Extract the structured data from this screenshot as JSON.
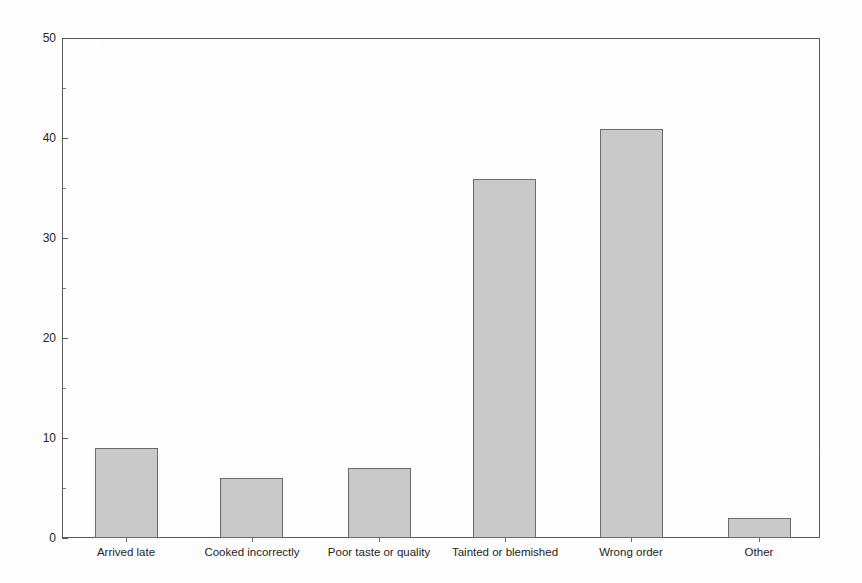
{
  "chart_data": {
    "type": "bar",
    "title": "",
    "subtitle": "",
    "xlabel": "",
    "ylabel": "",
    "categories": [
      "Arrived late",
      "Cooked incorrectly",
      "Poor taste or quality",
      "Tainted or blemished",
      "Wrong order",
      "Other"
    ],
    "values": [
      9,
      6,
      7,
      36,
      41,
      2
    ],
    "ylim": [
      0,
      50
    ],
    "y_major_ticks": [
      0,
      10,
      20,
      30,
      40,
      50
    ],
    "y_minor_ticks": [
      5,
      15,
      25,
      35,
      45
    ],
    "y_tick_labels": [
      "0",
      "10",
      "20",
      "30",
      "40",
      "50"
    ],
    "grid": false,
    "legend": null,
    "legend_position": "none",
    "annotations": [],
    "bar_fill_color": "#c9c9c9",
    "bar_border_color": "#6b6b6b",
    "axis_color": "#5a5a5a",
    "background_color": "#fdfdfd",
    "text_color": "#242424"
  }
}
